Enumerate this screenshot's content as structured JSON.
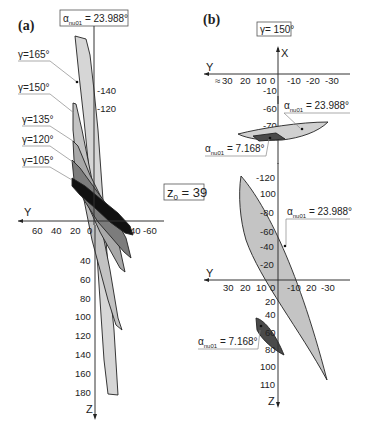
{
  "figure": {
    "panel_a": {
      "label": "(a)",
      "alpha_box": {
        "prefix": "α",
        "sub": "nu01",
        "value": " = 23.988°"
      },
      "gamma_labels": [
        "γ=165°",
        "γ=150°",
        "γ=135°",
        "γ=120°",
        "γ=105°"
      ],
      "y_axis_name": "Y",
      "z_axis_name": "Z",
      "y_ticks": [
        "60",
        "40",
        "20",
        "0",
        "40",
        "-60"
      ],
      "z_ticks_negative": [
        "-140",
        "-120"
      ],
      "z_ticks_positive": [
        "40",
        "60",
        "80",
        "100",
        "120",
        "140",
        "160",
        "180"
      ],
      "fills": {
        "g165": "#d6d6d6",
        "g150": "#c2c2c2",
        "g135": "#a8a8a8",
        "g120": "#7c7c7c",
        "g105": "#111111"
      }
    },
    "center": {
      "z0_prefix": "z",
      "z0_sub": "0",
      "z0_value": " = 39"
    },
    "panel_b": {
      "label": "(b)",
      "gamma_box": "γ= 150°",
      "top_plot": {
        "x_axis_name": "X",
        "y_axis_name": "Y",
        "approx_symbol": "≈",
        "y_ticks": [
          "30",
          "20",
          "10",
          "0",
          "-10",
          "-20",
          "-30"
        ],
        "x_ticks": [
          "-10",
          "-60",
          "-70"
        ],
        "alpha_upper": {
          "prefix": "α",
          "sub": "nu01",
          "value": " = 23.988°"
        },
        "alpha_lower": {
          "prefix": "α",
          "sub": "nu01",
          "value": " = 7.168°"
        }
      },
      "bottom_plot": {
        "y_axis_name": "Y",
        "z_axis_name": "Z",
        "y_ticks": [
          "30",
          "20",
          "10",
          "0",
          "-10",
          "20",
          "-30"
        ],
        "z_ticks_negative": [
          "-120",
          "100",
          "-80",
          "-60",
          "-40",
          "-20"
        ],
        "z_ticks_positive": [
          "20",
          "40",
          "60",
          "80",
          "100",
          "110"
        ],
        "alpha_upper": {
          "prefix": "α",
          "sub": "nu01",
          "value": " = 23.988°"
        },
        "alpha_lower": {
          "prefix": "α",
          "sub": "nu01",
          "value": " = 7.168°"
        }
      },
      "fills": {
        "light": "#c4c4c4",
        "top_light": "#d0d0d0",
        "dark": "#4a4a4a"
      }
    }
  }
}
